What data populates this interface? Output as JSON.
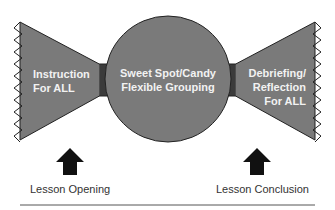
{
  "diagram": {
    "left_wing": {
      "line1": "Instruction",
      "line2": "For ALL"
    },
    "center": {
      "line1": "Sweet Spot/Candy",
      "line2": "Flexible Grouping"
    },
    "right_wing": {
      "line1": "Debriefing/",
      "line2": "Reflection",
      "line3": "For ALL"
    },
    "captions": {
      "left": "Lesson Opening",
      "right": "Lesson Conclusion"
    },
    "colors": {
      "fill": "#7a7a7a",
      "stroke": "#222222",
      "arrow": "#111111"
    }
  }
}
